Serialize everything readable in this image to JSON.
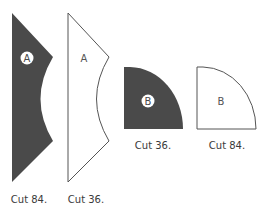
{
  "pieces": [
    {
      "id": "A",
      "variant": "dark",
      "letter": "A",
      "caption": "Cut 84."
    },
    {
      "id": "A",
      "variant": "outline",
      "letter": "A",
      "caption": "Cut 36."
    },
    {
      "id": "B",
      "variant": "dark",
      "letter": "B",
      "caption": "Cut 36."
    },
    {
      "id": "B",
      "variant": "outline",
      "letter": "B",
      "caption": "Cut 84."
    }
  ],
  "colors": {
    "dark_fill": "#4a4a4a",
    "outline_stroke": "#555555",
    "letter_on_dark": "#4a4a4a",
    "letter_on_light": "#555555",
    "badge_fill": "#ffffff"
  }
}
